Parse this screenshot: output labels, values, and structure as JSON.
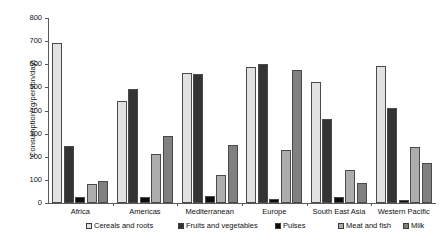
{
  "chart_data": {
    "type": "bar",
    "title": "",
    "xlabel": "",
    "ylabel": "Consumption (g/person/day)",
    "ylim": [
      0,
      800
    ],
    "ytick_step": 100,
    "yticks": [
      "800",
      "700",
      "600",
      "500",
      "400",
      "300",
      "200",
      "100",
      "0"
    ],
    "grid": false,
    "legend_position": "bottom",
    "categories": [
      "Africa",
      "Americas",
      "Mediterranean",
      "Europe",
      "South East Asia",
      "Western Pacific"
    ],
    "series": [
      {
        "name": "Cereals and roots",
        "color": "#e2e2e2",
        "values": [
          690,
          440,
          563,
          588,
          525,
          592
        ]
      },
      {
        "name": "Fruits and vegetables",
        "color": "#343434",
        "values": [
          245,
          495,
          558,
          602,
          365,
          410
        ]
      },
      {
        "name": "Pulses",
        "color": "#0d0d0d",
        "values": [
          28,
          24,
          30,
          17,
          25,
          14
        ]
      },
      {
        "name": "Meat and fish",
        "color": "#adadad",
        "values": [
          82,
          213,
          122,
          231,
          143,
          243
        ]
      },
      {
        "name": "Milk",
        "color": "#808080",
        "values": [
          94,
          291,
          249,
          575,
          85,
          171
        ]
      }
    ]
  },
  "colors": {
    "axis": "#5a5a5a",
    "bar_outline": "#4a4a4a",
    "text": "#111111",
    "background": "#ffffff"
  }
}
